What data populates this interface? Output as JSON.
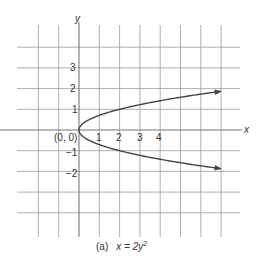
{
  "chart_data": {
    "type": "line",
    "title": "",
    "caption_prefix": "(a)",
    "caption_equation": "x = 2y",
    "caption_exponent": "2",
    "xlabel": "x",
    "ylabel": "y",
    "origin_label": "(0, 0)",
    "x_tick_labels": [
      "1",
      "2",
      "3",
      "4"
    ],
    "y_tick_labels": [
      "3",
      "2",
      "1",
      "−1",
      "−2"
    ],
    "xlim": [
      -3,
      8
    ],
    "ylim": [
      -5,
      5
    ],
    "grid": true,
    "series": [
      {
        "name": "x = 2y^2",
        "equation": "x = 2y^2",
        "x": [
          7.0,
          4.5,
          2.0,
          1.0,
          0.5,
          0.125,
          0,
          0.125,
          0.5,
          1.0,
          2.0,
          4.5,
          7.0
        ],
        "y": [
          1.87,
          1.5,
          1.0,
          0.707,
          0.5,
          0.25,
          0,
          -0.25,
          -0.5,
          -0.707,
          -1.0,
          -1.5,
          -1.87
        ],
        "arrows": [
          "upper-end",
          "lower-end"
        ]
      }
    ]
  },
  "colors": {
    "grid": "#9a9a9a",
    "axis": "#777777",
    "curve": "#444444",
    "text": "#333333"
  }
}
